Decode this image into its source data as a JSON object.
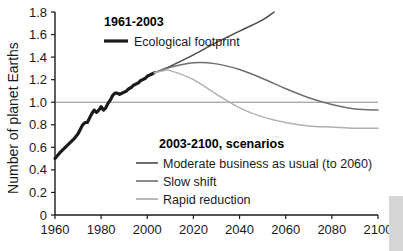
{
  "chart_data": {
    "type": "line",
    "title": "",
    "xlabel": "",
    "ylabel": "Number of planet Earths",
    "xlim": [
      1960,
      2100
    ],
    "ylim": [
      0,
      1.8
    ],
    "grid": false,
    "legend_position": "inside",
    "x_ticks": [
      "1960",
      "1980",
      "2000",
      "2020",
      "2040",
      "2060",
      "2080",
      "2100"
    ],
    "x_tick_values": [
      1960,
      1980,
      2000,
      2020,
      2040,
      2060,
      2080,
      2100
    ],
    "y_ticks": [
      "0",
      "0.2",
      "0.4",
      "0.6",
      "0.8",
      "1.0",
      "1.2",
      "1.4",
      "1.6",
      "1.8"
    ],
    "y_tick_values": [
      0,
      0.2,
      0.4,
      0.6,
      0.8,
      1.0,
      1.2,
      1.4,
      1.6,
      1.8
    ],
    "reference_line": {
      "y": 1.0,
      "label": "one planet Earth"
    },
    "series": [
      {
        "name": "Ecological footprint",
        "group": "1961-2003",
        "color": "#1a1a1a",
        "width": 3.2,
        "x": [
          1960,
          1962,
          1964,
          1966,
          1968,
          1970,
          1971,
          1972,
          1973,
          1974,
          1975,
          1976,
          1977,
          1978,
          1979,
          1980,
          1981,
          1982,
          1983,
          1984,
          1985,
          1986,
          1987,
          1988,
          1989,
          1990,
          1991,
          1992,
          1993,
          1994,
          1995,
          1996,
          1997,
          1998,
          1999,
          2000,
          2001,
          2002,
          2003
        ],
        "values": [
          0.5,
          0.55,
          0.59,
          0.63,
          0.67,
          0.72,
          0.76,
          0.8,
          0.82,
          0.82,
          0.86,
          0.9,
          0.93,
          0.91,
          0.93,
          0.96,
          0.93,
          0.95,
          0.99,
          1.02,
          1.06,
          1.08,
          1.08,
          1.07,
          1.08,
          1.09,
          1.1,
          1.12,
          1.13,
          1.15,
          1.16,
          1.17,
          1.19,
          1.2,
          1.21,
          1.23,
          1.24,
          1.25,
          1.26
        ]
      },
      {
        "name": "Moderate business as usual (to 2060)",
        "group": "2003-2100, scenarios",
        "color": "#4a4a4a",
        "width": 1.5,
        "x": [
          2003,
          2010,
          2020,
          2030,
          2040,
          2050,
          2055
        ],
        "values": [
          1.26,
          1.32,
          1.42,
          1.53,
          1.63,
          1.73,
          1.8
        ]
      },
      {
        "name": "Slow shift",
        "group": "2003-2100, scenarios",
        "color": "#6e6e6e",
        "width": 1.5,
        "x": [
          2003,
          2010,
          2020,
          2030,
          2040,
          2050,
          2060,
          2070,
          2080,
          2090,
          2100
        ],
        "values": [
          1.26,
          1.31,
          1.35,
          1.34,
          1.29,
          1.21,
          1.12,
          1.04,
          0.98,
          0.94,
          0.93
        ]
      },
      {
        "name": "Rapid reduction",
        "group": "2003-2100, scenarios",
        "color": "#b0b0b0",
        "width": 1.5,
        "x": [
          2003,
          2007,
          2010,
          2020,
          2030,
          2040,
          2050,
          2060,
          2070,
          2080,
          2090,
          2100
        ],
        "values": [
          1.26,
          1.28,
          1.28,
          1.2,
          1.07,
          0.95,
          0.87,
          0.82,
          0.79,
          0.78,
          0.77,
          0.77
        ]
      }
    ],
    "legends": [
      {
        "heading": "1961-2003",
        "entries": [
          {
            "label": "Ecological footprint",
            "color": "#1a1a1a",
            "width": 3.2
          }
        ]
      },
      {
        "heading": "2003-2100, scenarios",
        "entries": [
          {
            "label": "Moderate business as usual (to 2060)",
            "color": "#4a4a4a",
            "width": 1.5
          },
          {
            "label": "Slow shift",
            "color": "#6e6e6e",
            "width": 1.5
          },
          {
            "label": "Rapid reduction",
            "color": "#b0b0b0",
            "width": 1.5
          }
        ]
      }
    ]
  },
  "colors": {
    "axis": "#1a1a1a",
    "reference_line": "#8a8a8a",
    "background": "#ffffff",
    "edge_strip": "#d6d6d6"
  }
}
